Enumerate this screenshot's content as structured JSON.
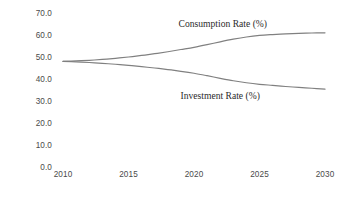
{
  "chart_data": {
    "type": "line",
    "title": "",
    "xlabel": "",
    "ylabel": "",
    "xlim": [
      2010,
      2030
    ],
    "ylim": [
      0.0,
      70.0
    ],
    "grid": false,
    "legend_position": "inline-annotation",
    "x_tick_labels": [
      "2010",
      "2015",
      "2020",
      "2025",
      "2030"
    ],
    "x_ticks": [
      2010,
      2015,
      2020,
      2025,
      2030
    ],
    "y_tick_labels": [
      "70.0",
      "60.0",
      "50.0",
      "40.0",
      "30.0",
      "20.0",
      "10.0",
      "0.0"
    ],
    "y_ticks": [
      70.0,
      60.0,
      50.0,
      40.0,
      30.0,
      20.0,
      10.0,
      0.0
    ],
    "x": [
      2010,
      2011,
      2012,
      2013,
      2014,
      2015,
      2016,
      2017,
      2018,
      2019,
      2020,
      2021,
      2022,
      2023,
      2024,
      2025,
      2026,
      2027,
      2028,
      2029,
      2030
    ],
    "series": [
      {
        "name": "Consumption Rate (%)",
        "color": "#808080",
        "values": [
          48.0,
          48.2,
          48.5,
          48.9,
          49.4,
          50.0,
          50.7,
          51.5,
          52.4,
          53.4,
          54.4,
          55.6,
          56.9,
          58.1,
          59.1,
          59.8,
          60.2,
          60.5,
          60.7,
          60.9,
          61.0
        ]
      },
      {
        "name": "Investment Rate (%)",
        "color": "#808080",
        "values": [
          48.0,
          47.8,
          47.5,
          47.1,
          46.7,
          46.2,
          45.6,
          45.0,
          44.3,
          43.5,
          42.6,
          41.5,
          40.3,
          39.2,
          38.3,
          37.6,
          37.1,
          36.6,
          36.2,
          35.8,
          35.4
        ]
      }
    ],
    "annotations": [
      {
        "text": "Consumption Rate (%)",
        "x": 2022.2,
        "y": 65.0,
        "anchor": "middle"
      },
      {
        "text": "Investment Rate (%)",
        "x": 2022.0,
        "y": 32.5,
        "anchor": "middle"
      }
    ]
  },
  "style": {
    "background": "#ffffff",
    "line_color": "#808080",
    "tick_label_color": "#4a4a4a",
    "annotation_color": "#2b2b2b"
  }
}
